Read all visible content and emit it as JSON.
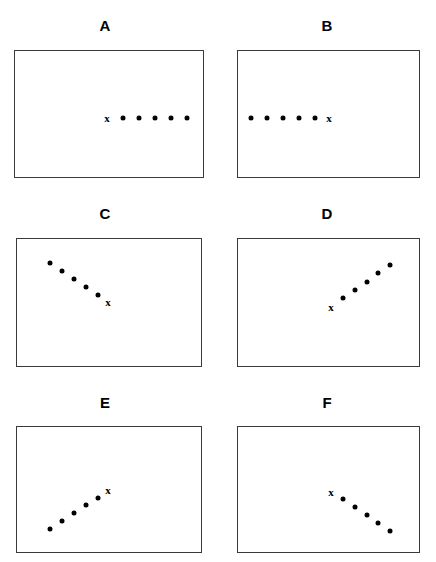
{
  "figure": {
    "title": "",
    "width": 436,
    "height": 562,
    "background": "#ffffff",
    "marker_color": "#000000",
    "box_border_color": "#3a3a3a"
  },
  "chart_data": {
    "type": "scatter",
    "title": "",
    "xlabel": "",
    "ylabel": "",
    "grid": false,
    "legend": "none",
    "panels": [
      {
        "label": "A",
        "box": {
          "x": 14,
          "y": 50,
          "width": 190,
          "height": 128
        },
        "label_pos": {
          "x": 105,
          "y": 25
        },
        "marker_label": "x",
        "marker_point": {
          "x": 106,
          "y": 117
        },
        "direction": "horizontal-right",
        "dot_count": 5,
        "dots": [
          {
            "x": 122,
            "y": 117
          },
          {
            "x": 138,
            "y": 117
          },
          {
            "x": 154,
            "y": 117
          },
          {
            "x": 170,
            "y": 117
          },
          {
            "x": 186,
            "y": 117
          }
        ]
      },
      {
        "label": "B",
        "box": {
          "x": 237,
          "y": 50,
          "width": 183,
          "height": 128
        },
        "label_pos": {
          "x": 327,
          "y": 25
        },
        "marker_label": "x",
        "marker_point": {
          "x": 328,
          "y": 117
        },
        "direction": "horizontal-left",
        "dot_count": 5,
        "dots": [
          {
            "x": 250,
            "y": 117
          },
          {
            "x": 266,
            "y": 117
          },
          {
            "x": 282,
            "y": 117
          },
          {
            "x": 298,
            "y": 117
          },
          {
            "x": 314,
            "y": 117
          }
        ]
      },
      {
        "label": "C",
        "box": {
          "x": 16,
          "y": 238,
          "width": 186,
          "height": 129
        },
        "label_pos": {
          "x": 105,
          "y": 213
        },
        "marker_label": "x",
        "marker_point": {
          "x": 107,
          "y": 301
        },
        "direction": "diagonal-down-right",
        "dot_count": 5,
        "dots": [
          {
            "x": 49,
            "y": 262
          },
          {
            "x": 61,
            "y": 270
          },
          {
            "x": 73,
            "y": 278
          },
          {
            "x": 85,
            "y": 286
          },
          {
            "x": 97,
            "y": 294
          }
        ]
      },
      {
        "label": "D",
        "box": {
          "x": 237,
          "y": 238,
          "width": 183,
          "height": 129
        },
        "label_pos": {
          "x": 327,
          "y": 213
        },
        "marker_label": "x",
        "marker_point": {
          "x": 330,
          "y": 306
        },
        "direction": "diagonal-up-right",
        "dot_count": 5,
        "dots": [
          {
            "x": 342,
            "y": 297
          },
          {
            "x": 354,
            "y": 289
          },
          {
            "x": 366,
            "y": 281
          },
          {
            "x": 377,
            "y": 272
          },
          {
            "x": 389,
            "y": 264
          }
        ]
      },
      {
        "label": "E",
        "box": {
          "x": 16,
          "y": 426,
          "width": 186,
          "height": 127
        },
        "label_pos": {
          "x": 105,
          "y": 402
        },
        "marker_label": "x",
        "marker_point": {
          "x": 107,
          "y": 489
        },
        "direction": "diagonal-up-right",
        "dot_count": 5,
        "dots": [
          {
            "x": 49,
            "y": 528
          },
          {
            "x": 61,
            "y": 520
          },
          {
            "x": 73,
            "y": 512
          },
          {
            "x": 85,
            "y": 504
          },
          {
            "x": 97,
            "y": 497
          }
        ]
      },
      {
        "label": "F",
        "box": {
          "x": 237,
          "y": 426,
          "width": 183,
          "height": 127
        },
        "label_pos": {
          "x": 327,
          "y": 402
        },
        "marker_label": "x",
        "marker_point": {
          "x": 330,
          "y": 491
        },
        "direction": "diagonal-down-right",
        "dot_count": 5,
        "dots": [
          {
            "x": 342,
            "y": 498
          },
          {
            "x": 354,
            "y": 506
          },
          {
            "x": 366,
            "y": 514
          },
          {
            "x": 377,
            "y": 522
          },
          {
            "x": 389,
            "y": 530
          }
        ]
      }
    ]
  }
}
